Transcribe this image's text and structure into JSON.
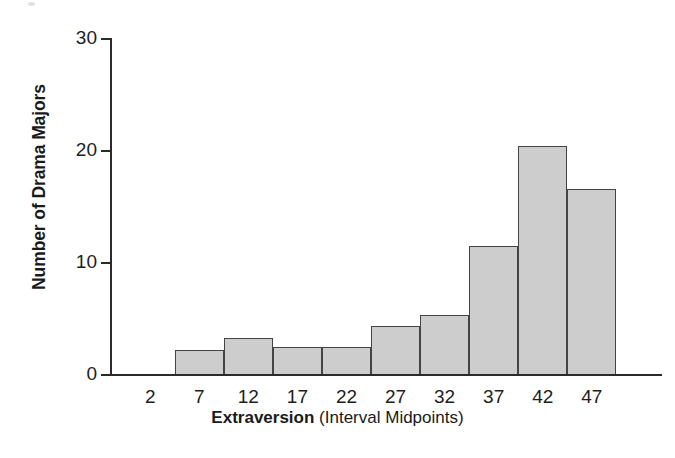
{
  "chart_data": {
    "type": "bar",
    "title": "",
    "xlabel": "Extraversion (Interval Midpoints)",
    "xlabel_bold_part": "Extraversion",
    "xlabel_regular_part": " (Interval Midpoints)",
    "ylabel": "Number of Drama Majors",
    "categories": [
      "2",
      "7",
      "12",
      "17",
      "22",
      "27",
      "32",
      "37",
      "42",
      "47"
    ],
    "values": [
      0,
      2.1,
      3.2,
      2.4,
      2.4,
      4.3,
      5.3,
      11.4,
      20.4,
      16.5
    ],
    "ylim": [
      0,
      30
    ],
    "yticks": [
      "0",
      "10",
      "20",
      "30"
    ],
    "ytick_values": [
      0,
      10,
      20,
      30
    ],
    "grid": false,
    "legend": "none",
    "bar_fill_color": "#cdcdcd",
    "bar_border_color": "#444444",
    "axis_color": "#2b2b2b"
  }
}
